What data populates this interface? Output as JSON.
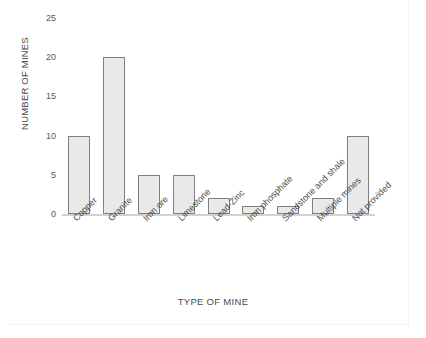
{
  "chart_data": {
    "type": "bar",
    "title": "",
    "xlabel": "TYPE OF MINE",
    "ylabel": "NUMBER OF MINES",
    "categories": [
      "Copper",
      "Granite",
      "Iron ore",
      "Limestone",
      "Lead-Zinc",
      "Iron phosphate",
      "Sandstone and shale",
      "Multiple mines",
      "Not provided"
    ],
    "values": [
      10,
      20,
      5,
      5,
      2,
      1,
      1,
      2,
      10
    ],
    "ylim": [
      0,
      25
    ],
    "yticks": [
      0,
      5,
      10,
      15,
      20,
      25
    ],
    "ytick_labels": [
      "0",
      "5",
      "10",
      "15",
      "20",
      "25"
    ],
    "grid": false,
    "legend": null,
    "bar_fill_color": "#e9e9e9",
    "bar_edge_color": "#7f7f7f",
    "axis_color": "#d2d2d2",
    "text_color": "#4d4d4d",
    "background_color": "#ffffff",
    "xtick_rotation_degrees": -45
  }
}
